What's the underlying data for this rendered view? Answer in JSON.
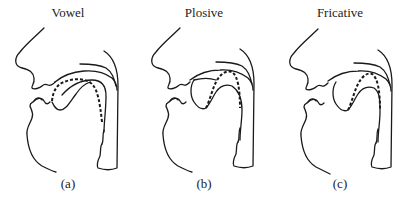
{
  "figure": {
    "panels": [
      {
        "title": "Vowel",
        "label": "(a)",
        "tongue_position": "low-back (open tract)"
      },
      {
        "title": "Plosive",
        "label": "(b)",
        "tongue_position": "tongue tip raised to alveolar ridge (closure)"
      },
      {
        "title": "Fricative",
        "label": "(c)",
        "tongue_position": "tongue tip near alveolar ridge (narrow constriction)"
      }
    ],
    "legend": {
      "solid_line": "vocal tract outline / articulator",
      "dashed_line": "tongue contour"
    },
    "colors": {
      "stroke": "#1a1a1a",
      "background": "#ffffff"
    }
  }
}
